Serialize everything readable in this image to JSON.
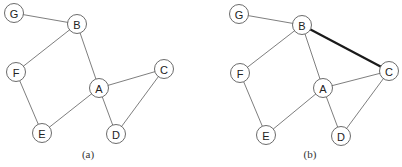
{
  "graphs": [
    {
      "id": "a",
      "caption": "(a)",
      "caption_pos": [
        88,
        158
      ],
      "nodes": [
        {
          "label": "G",
          "x": 14,
          "y": 13
        },
        {
          "label": "B",
          "x": 77,
          "y": 24
        },
        {
          "label": "F",
          "x": 16,
          "y": 72
        },
        {
          "label": "A",
          "x": 99,
          "y": 88
        },
        {
          "label": "C",
          "x": 164,
          "y": 69
        },
        {
          "label": "E",
          "x": 42,
          "y": 133
        },
        {
          "label": "D",
          "x": 116,
          "y": 134
        }
      ],
      "edges": [
        {
          "from": "G",
          "to": "B",
          "highlight": false
        },
        {
          "from": "B",
          "to": "F",
          "highlight": false
        },
        {
          "from": "B",
          "to": "A",
          "highlight": false
        },
        {
          "from": "F",
          "to": "E",
          "highlight": false
        },
        {
          "from": "E",
          "to": "A",
          "highlight": false
        },
        {
          "from": "A",
          "to": "C",
          "highlight": false
        },
        {
          "from": "A",
          "to": "D",
          "highlight": false
        },
        {
          "from": "C",
          "to": "D",
          "highlight": false
        }
      ]
    },
    {
      "id": "b",
      "caption": "(b)",
      "caption_pos": [
        310,
        158
      ],
      "nodes": [
        {
          "label": "G",
          "x": 239,
          "y": 14
        },
        {
          "label": "B",
          "x": 302,
          "y": 25
        },
        {
          "label": "F",
          "x": 240,
          "y": 73
        },
        {
          "label": "A",
          "x": 323,
          "y": 88
        },
        {
          "label": "C",
          "x": 389,
          "y": 71
        },
        {
          "label": "E",
          "x": 266,
          "y": 135
        },
        {
          "label": "D",
          "x": 341,
          "y": 136
        }
      ],
      "edges": [
        {
          "from": "G",
          "to": "B",
          "highlight": false
        },
        {
          "from": "B",
          "to": "F",
          "highlight": false
        },
        {
          "from": "B",
          "to": "A",
          "highlight": false
        },
        {
          "from": "B",
          "to": "C",
          "highlight": true
        },
        {
          "from": "F",
          "to": "E",
          "highlight": false
        },
        {
          "from": "E",
          "to": "A",
          "highlight": false
        },
        {
          "from": "A",
          "to": "C",
          "highlight": false
        },
        {
          "from": "A",
          "to": "D",
          "highlight": false
        },
        {
          "from": "C",
          "to": "D",
          "highlight": false
        }
      ]
    }
  ],
  "node_radius": 9.5
}
